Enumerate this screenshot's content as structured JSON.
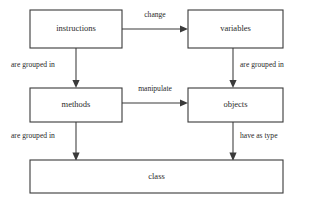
{
  "diagram": {
    "background_color": "#ffffff",
    "line_color": "#3a3a3a",
    "text_color": "#2a2a2a",
    "nodes": [
      {
        "id": "instructions",
        "label": "instructions",
        "x": 30,
        "y": 10,
        "w": 92,
        "h": 38
      },
      {
        "id": "variables",
        "label": "variables",
        "x": 188,
        "y": 10,
        "w": 95,
        "h": 38
      },
      {
        "id": "methods",
        "label": "methods",
        "x": 30,
        "y": 88,
        "w": 92,
        "h": 34
      },
      {
        "id": "objects",
        "label": "objects",
        "x": 188,
        "y": 88,
        "w": 95,
        "h": 34
      },
      {
        "id": "class",
        "label": "class",
        "x": 30,
        "y": 160,
        "w": 253,
        "h": 33
      }
    ],
    "edges": [
      {
        "id": "instructions-variables",
        "from": "instructions",
        "to": "variables",
        "label": "change",
        "label_x": 155,
        "label_y": 15,
        "label_align": "mid"
      },
      {
        "id": "instructions-methods",
        "from": "instructions",
        "to": "methods",
        "label": "are grouped in",
        "label_x": 11,
        "label_y": 65,
        "label_align": "start"
      },
      {
        "id": "variables-objects",
        "from": "variables",
        "to": "objects",
        "label": "are grouped in",
        "label_x": 240,
        "label_y": 65,
        "label_align": "start"
      },
      {
        "id": "methods-objects",
        "from": "methods",
        "to": "objects",
        "label": "manipulate",
        "label_x": 155,
        "label_y": 89,
        "label_align": "mid"
      },
      {
        "id": "methods-class",
        "from": "methods",
        "to": "class",
        "label": "are grouped in",
        "label_x": 11,
        "label_y": 136,
        "label_align": "start"
      },
      {
        "id": "objects-class",
        "from": "objects",
        "to": "class",
        "label": "have as type",
        "label_x": 240,
        "label_y": 136,
        "label_align": "start"
      }
    ]
  }
}
